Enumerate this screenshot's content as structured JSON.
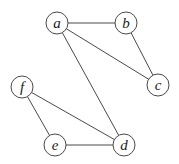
{
  "graph": {
    "stroke_color": "#4a4a4a",
    "node_radius": 11,
    "nodes": [
      {
        "id": "a",
        "label": "a",
        "x": 57,
        "y": 23
      },
      {
        "id": "b",
        "label": "b",
        "x": 126,
        "y": 23
      },
      {
        "id": "c",
        "label": "c",
        "x": 158,
        "y": 85
      },
      {
        "id": "f",
        "label": "f",
        "x": 22,
        "y": 87
      },
      {
        "id": "e",
        "label": "e",
        "x": 55,
        "y": 145
      },
      {
        "id": "d",
        "label": "d",
        "x": 124,
        "y": 145
      }
    ],
    "edges": [
      {
        "from": "a",
        "to": "b"
      },
      {
        "from": "a",
        "to": "c"
      },
      {
        "from": "a",
        "to": "d"
      },
      {
        "from": "b",
        "to": "c"
      },
      {
        "from": "f",
        "to": "d"
      },
      {
        "from": "f",
        "to": "e"
      },
      {
        "from": "e",
        "to": "d"
      }
    ]
  }
}
